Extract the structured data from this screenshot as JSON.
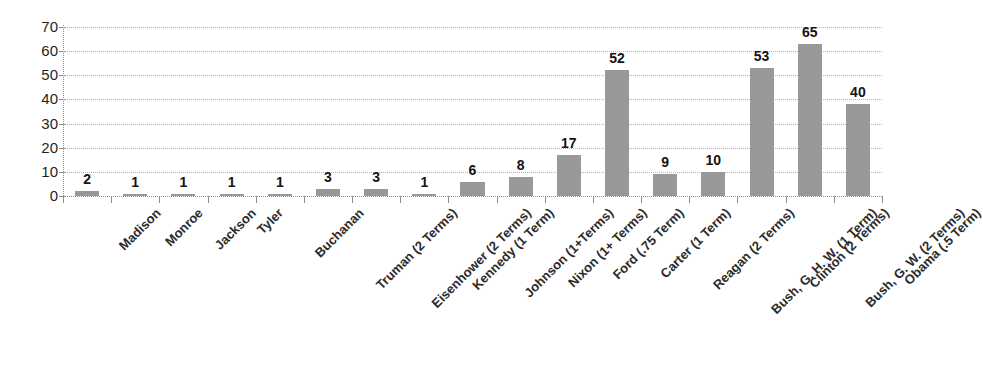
{
  "chart_data": {
    "type": "bar",
    "title": "",
    "subtitle": "",
    "xlabel": "",
    "ylabel": "",
    "ylim": [
      0,
      70
    ],
    "ytick_step": 10,
    "yticks": [
      70,
      60,
      50,
      40,
      30,
      20,
      10,
      0
    ],
    "grid": true,
    "legend": false,
    "legend_position": "none",
    "bar_color": "#969696",
    "data_label_color": "#141414",
    "axis_color": "#8d8d8d",
    "gridline_color": "#b4b4b4",
    "categories": [
      "Madison",
      "Monroe",
      "Jackson",
      "Tyler",
      "Buchanan",
      "Truman (2 Terms)",
      "Eisenhower (2 Terms)",
      "Kennedy (1 Term)",
      "Johnson (1+Terms)",
      "Nixon (1+ Terms)",
      "Ford (.75 Term)",
      "Carter (1 Term)",
      "Reagan (2 Terms)",
      "Bush, G. H. W. (1 Term)",
      "Clinton (2 Terms)",
      "Bush, G. W. (2 Terms)",
      "Obama (.5 Term)"
    ],
    "values": [
      2,
      1,
      1,
      1,
      1,
      3,
      3,
      1,
      6,
      8,
      17,
      52,
      9,
      10,
      53,
      65,
      40
    ],
    "data_labels": [
      "2",
      "1",
      "1",
      "1",
      "1",
      "3",
      "3",
      "1",
      "6",
      "8",
      "17",
      "52",
      "9",
      "10",
      "53",
      "65",
      "40"
    ],
    "bar_heights_drawn": [
      2,
      1,
      1,
      1,
      1,
      3,
      3,
      1,
      6,
      8,
      17,
      52,
      9,
      10,
      53,
      63,
      38
    ]
  }
}
